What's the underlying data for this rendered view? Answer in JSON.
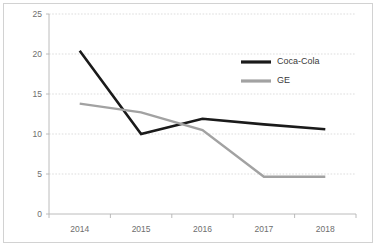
{
  "chart_data": {
    "type": "line",
    "title": "",
    "subtitle": "",
    "xlabel": "",
    "ylabel": "",
    "categories": [
      "2014",
      "2015",
      "2016",
      "2017",
      "2018"
    ],
    "series": [
      {
        "name": "Coca-Cola",
        "color": "#1a1a1a",
        "values": [
          20.4,
          10.0,
          11.9,
          11.2,
          10.6
        ]
      },
      {
        "name": "GE",
        "color": "#a2a2a2",
        "values": [
          13.8,
          12.7,
          10.5,
          4.65,
          4.65
        ]
      }
    ],
    "ylim": [
      0,
      25
    ],
    "yticks": [
      0,
      5,
      10,
      15,
      20,
      25
    ],
    "ytick_labels": [
      "0",
      "5",
      "10",
      "15",
      "20",
      "25"
    ],
    "xtick_labels": [
      "2014",
      "2015",
      "2016",
      "2017",
      "2018"
    ],
    "grid": true,
    "grid_axis": "y",
    "legend_position": "inside-top-right",
    "legend_entries": [
      "Coca-Cola",
      "GE"
    ],
    "annotations": []
  },
  "style": {
    "background_color": "#ffffff",
    "border_color": "#d2d2d2",
    "grid_color": "#cfcfcf",
    "axis_color": "#b4b4b4",
    "tick_text_color": "#6e6e6e",
    "legend_text_color": "#3a3a3a"
  }
}
